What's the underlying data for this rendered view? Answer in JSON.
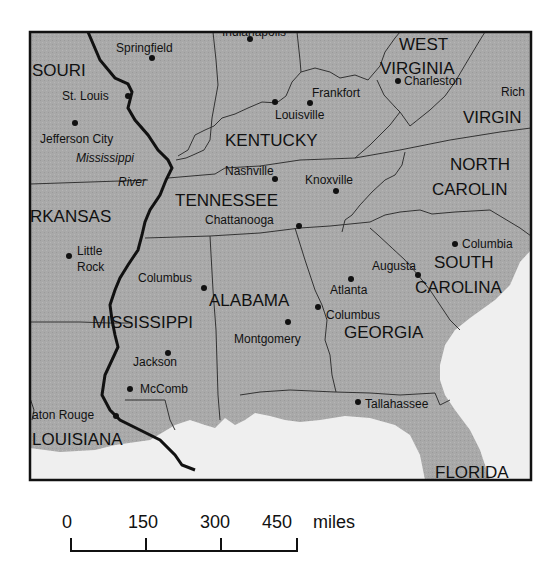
{
  "map": {
    "colors": {
      "land": "#a9a9a9",
      "water": "#efefef",
      "borders": "#333333",
      "river": "#111111",
      "frame": "#111111"
    },
    "states": [
      {
        "id": "missouri",
        "label": "SOURI",
        "x": 32,
        "y": 76
      },
      {
        "id": "west-virginia-1",
        "label": "WEST",
        "x": 399,
        "y": 50
      },
      {
        "id": "west-virginia-2",
        "label": "VIRGINIA",
        "x": 382,
        "y": 74
      },
      {
        "id": "virginia",
        "label": "VIRGIN",
        "x": 463,
        "y": 123
      },
      {
        "id": "kentucky",
        "label": "KENTUCKY",
        "x": 225,
        "y": 146
      },
      {
        "id": "north-carolina-1",
        "label": "NORTH",
        "x": 450,
        "y": 170
      },
      {
        "id": "north-carolina-2",
        "label": "CAROLIN",
        "x": 432,
        "y": 195
      },
      {
        "id": "tennessee",
        "label": "TENNESSEE",
        "x": 175,
        "y": 206
      },
      {
        "id": "arkansas",
        "label": "RKANSAS",
        "x": 32,
        "y": 222
      },
      {
        "id": "south-carolina-1",
        "label": "SOUTH",
        "x": 434,
        "y": 268
      },
      {
        "id": "south-carolina-2",
        "label": "CAROLINA",
        "x": 415,
        "y": 293
      },
      {
        "id": "alabama",
        "label": "ALABAMA",
        "x": 209,
        "y": 306
      },
      {
        "id": "mississippi",
        "label": "MISSISSIPPI",
        "x": 92,
        "y": 328
      },
      {
        "id": "georgia",
        "label": "GEORGIA",
        "x": 344,
        "y": 338
      },
      {
        "id": "louisiana",
        "label": "LOUISIANA",
        "x": 32,
        "y": 445
      },
      {
        "id": "florida",
        "label": "FLORIDA",
        "x": 435,
        "y": 477
      }
    ],
    "cities": [
      {
        "id": "springfield",
        "label": "Springfield",
        "dot": [
          152,
          58
        ],
        "x": 116,
        "y": 52
      },
      {
        "id": "indianapolis",
        "label": "Indianapolis",
        "dot": [
          250,
          39
        ],
        "x": 222,
        "y": 36
      },
      {
        "id": "st-louis",
        "label": "St. Louis",
        "dot": [
          128,
          96
        ],
        "x": 62,
        "y": 100
      },
      {
        "id": "frankfort",
        "label": "Frankfort",
        "dot": [
          310,
          103
        ],
        "x": 312,
        "y": 97
      },
      {
        "id": "charleston",
        "label": "Charleston",
        "dot": [
          398,
          81
        ],
        "x": 404,
        "y": 85
      },
      {
        "id": "richmond",
        "label": "Rich",
        "dot": [
          540,
          95
        ],
        "x": 501,
        "y": 95
      },
      {
        "id": "louisville",
        "label": "Louisville",
        "dot": [
          276,
          102
        ],
        "x": 275,
        "y": 119
      },
      {
        "id": "jefferson-city",
        "label": "Jefferson City",
        "dot": [
          75,
          123
        ],
        "x": 40,
        "y": 143
      },
      {
        "id": "nashville",
        "label": "Nashville",
        "dot": [
          275,
          179
        ],
        "x": 225,
        "y": 174
      },
      {
        "id": "knoxville",
        "label": "Knoxville",
        "dot": [
          336,
          191
        ],
        "x": 305,
        "y": 184
      },
      {
        "id": "chattanooga",
        "label": "Chattanooga",
        "dot": [
          299,
          226
        ],
        "x": 205,
        "y": 224
      },
      {
        "id": "columbia",
        "label": "Columbia",
        "dot": [
          455,
          244
        ],
        "x": 462,
        "y": 248
      },
      {
        "id": "little-rock-1",
        "label": "Little",
        "dot": [
          69,
          256
        ],
        "x": 77,
        "y": 255
      },
      {
        "id": "little-rock-2",
        "label": "Rock",
        "dot": null,
        "x": 77,
        "y": 271
      },
      {
        "id": "augusta",
        "label": "Augusta",
        "dot": [
          418,
          275
        ],
        "x": 372,
        "y": 270
      },
      {
        "id": "atlanta",
        "label": "Atlanta",
        "dot": [
          351,
          279
        ],
        "x": 330,
        "y": 294
      },
      {
        "id": "columbus-ms",
        "label": "Columbus",
        "dot": [
          204,
          288
        ],
        "x": 138,
        "y": 282
      },
      {
        "id": "columbus-ga",
        "label": "Columbus",
        "dot": [
          318,
          307
        ],
        "x": 326,
        "y": 319
      },
      {
        "id": "montgomery",
        "label": "Montgomery",
        "dot": [
          288,
          322
        ],
        "x": 234,
        "y": 343
      },
      {
        "id": "jackson",
        "label": "Jackson",
        "dot": [
          168,
          353
        ],
        "x": 133,
        "y": 366
      },
      {
        "id": "mccomb",
        "label": "McComb",
        "dot": [
          130,
          389
        ],
        "x": 140,
        "y": 393
      },
      {
        "id": "tallahassee",
        "label": "Tallahassee",
        "dot": [
          358,
          402
        ],
        "x": 365,
        "y": 408
      },
      {
        "id": "baton-rouge",
        "label": "aton Rouge",
        "dot": [
          116,
          416
        ],
        "x": 32,
        "y": 418
      }
    ],
    "river": {
      "label_1": "Mississippi",
      "label_2": "River"
    }
  },
  "scale_bar": {
    "ticks": [
      "0",
      "150",
      "300",
      "450"
    ],
    "unit": "miles"
  }
}
